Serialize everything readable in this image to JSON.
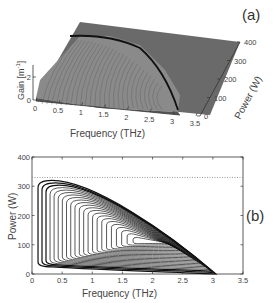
{
  "chart_data": [
    {
      "panel": "(a)",
      "type": "surface3d",
      "xlabel": "Frequency (THz)",
      "ylabel": "Power (W)",
      "zlabel": "Gain [m^-1]",
      "x_ticks": [
        "0",
        "0.5",
        "1",
        "1.5",
        "2",
        "2.5",
        "3",
        "3.5"
      ],
      "y_ticks": [
        "0",
        "100",
        "200",
        "300",
        "400"
      ],
      "z_ticks": [
        "0",
        "2"
      ],
      "xlim": [
        0,
        3.5
      ],
      "ylim": [
        0,
        400
      ],
      "surface_color": "#6e6e6e",
      "description": "Gain surface over frequency and power; gain region bounded by a curved ridge falling from ~0.2 THz at ~330 W to ~3 THz at 0 W"
    },
    {
      "panel": "(b)",
      "type": "contour",
      "xlabel": "Frequency (THz)",
      "ylabel": "Power (W)",
      "x_ticks": [
        "0",
        "0.5",
        "1",
        "1.5",
        "2",
        "2.5",
        "3",
        "3.5"
      ],
      "y_ticks": [
        "0",
        "100",
        "200",
        "300",
        "400"
      ],
      "xlim": [
        0,
        3.5
      ],
      "ylim": [
        0,
        400
      ],
      "grid": false,
      "threshold_line": {
        "y": 330,
        "style": "dotted"
      },
      "contour_count": 22,
      "contour_peak": {
        "x": 1.8,
        "y": 110
      },
      "contour_convergence": {
        "x": 3.05,
        "y": 0
      },
      "outer_contour": {
        "x_range": [
          0.1,
          3.05
        ],
        "y_range": [
          0,
          320
        ]
      }
    }
  ],
  "labels": {
    "panel_a": "(a)",
    "panel_b": "(b)",
    "xlabel": "Frequency (THz)",
    "power_label": "Power (W)",
    "gain_label": "Gain [m",
    "gain_sup": "-1",
    "gain_close": "]"
  }
}
